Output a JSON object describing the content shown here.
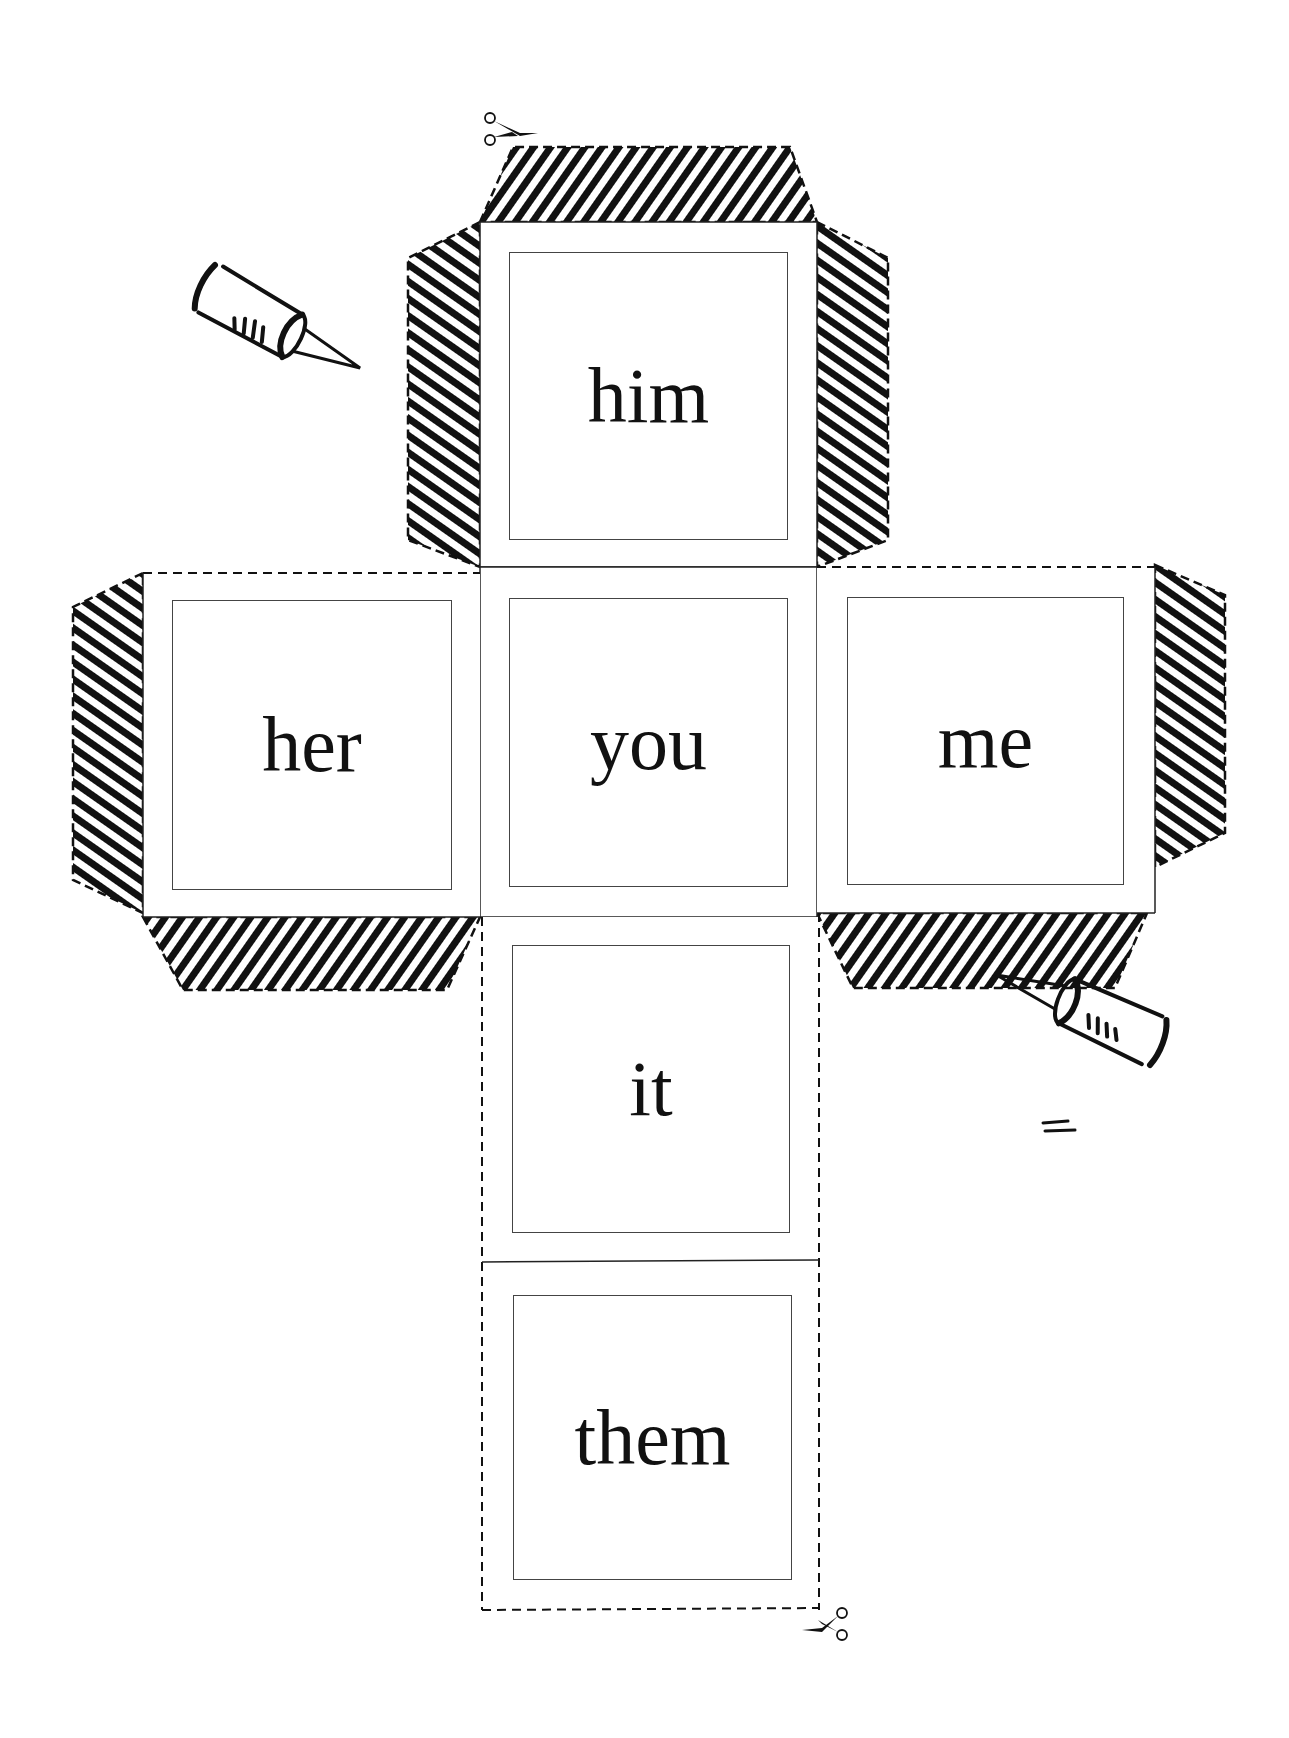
{
  "worksheet": {
    "type": "cube-net-printable",
    "faces": {
      "top": {
        "word": "him"
      },
      "left": {
        "word": "her"
      },
      "center": {
        "word": "you"
      },
      "right": {
        "word": "me"
      },
      "bottom1": {
        "word": "it"
      },
      "bottom2": {
        "word": "them"
      }
    },
    "icons": {
      "scissors_top": "scissors-icon",
      "scissors_bottom": "scissors-icon",
      "glue_top_left": "glue-bottle-icon",
      "glue_bottom_right": "glue-bottle-icon"
    },
    "colors": {
      "ink": "#111111",
      "paper": "#ffffff",
      "frame": "#444444"
    }
  }
}
